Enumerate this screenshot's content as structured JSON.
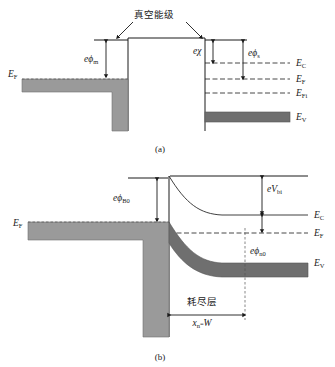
{
  "figure": {
    "panels": [
      {
        "tag": "(a)",
        "caption": "(a)"
      },
      {
        "tag": "(b)",
        "caption": "(b)"
      }
    ]
  },
  "panel_a": {
    "tag": "(a)",
    "vacuum_level_label": "真空能级",
    "metal_fermi_label": {
      "symbol": "E",
      "sub": "F"
    },
    "metal_workfunction": {
      "prefix": "e",
      "symbol": "ϕ",
      "sub": "m"
    },
    "electron_affinity": {
      "prefix": "e",
      "symbol": "χ",
      "sub": ""
    },
    "semiconductor_workfunction": {
      "prefix": "e",
      "symbol": "ϕ",
      "sub": "s"
    },
    "levels": [
      {
        "name": "conduction-band",
        "symbol": "E",
        "sub": "C"
      },
      {
        "name": "fermi-level",
        "symbol": "E",
        "sub": "F"
      },
      {
        "name": "intrinsic-fermi-level",
        "symbol": "E",
        "sub": "Fi"
      },
      {
        "name": "valence-band",
        "symbol": "E",
        "sub": "V"
      }
    ]
  },
  "panel_b": {
    "tag": "(b)",
    "metal_fermi_label": {
      "symbol": "E",
      "sub": "F"
    },
    "barrier_height": {
      "prefix": "e",
      "symbol": "ϕ",
      "sub": "B0"
    },
    "built_in_potential": {
      "prefix": "e",
      "symbol": "V",
      "sub": "bi"
    },
    "bulk_potential": {
      "prefix": "e",
      "symbol": "ϕ",
      "sub": "n0"
    },
    "depletion_layer_label": "耗尽层",
    "depletion_width": {
      "symbol": "x",
      "sub": "n",
      "eq": "=",
      "value": "W"
    },
    "levels": [
      {
        "name": "conduction-band",
        "symbol": "E",
        "sub": "C"
      },
      {
        "name": "fermi-level",
        "symbol": "E",
        "sub": "F"
      },
      {
        "name": "valence-band",
        "symbol": "E",
        "sub": "V"
      }
    ]
  },
  "colors": {
    "line": "#1a1a1a",
    "band_fill": "#9a9a9a",
    "band_fill_dark": "#6f6f6f",
    "background": "#ffffff"
  }
}
